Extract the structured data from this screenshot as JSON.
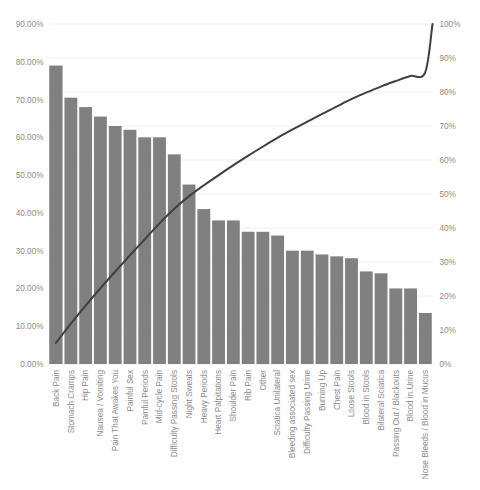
{
  "chart_data": {
    "type": "bar",
    "title": "",
    "subtitle": "",
    "xlabel": "",
    "ylabel": "",
    "y2label": "",
    "ylim": [
      0,
      90
    ],
    "y2lim": [
      0,
      100
    ],
    "grid": true,
    "legend": "none",
    "colors": {
      "bar": "#808080",
      "line": "#3f3f3f",
      "grid": "#e8e8e8",
      "text": "#8c8c8c",
      "background": "#ffffff"
    },
    "categories": [
      "Back Pain",
      "Stomach Cramps",
      "Hip Pain",
      "Nausea / Vomiting",
      "Pain That Awakes You",
      "Painful Sex",
      "Painful Periods",
      "Mid-cycle Pain",
      "Difficulty Passing Stools",
      "Night Sweats",
      "Heavy Periods",
      "Heart Palpitations",
      "Shoulder Pain",
      "Rib Pain",
      "Other",
      "Sciatica Unilateral",
      "Bleeding associated sex",
      "Difficulty Passing Urine",
      "Burning Up",
      "Chest Pain",
      "Loose Stools",
      "Blood in Stools",
      "Bilateral Sciatica",
      "Passing Out / Blackouts",
      "Blood in Urine",
      "Nose Bleeds / Blood in Mucus"
    ],
    "values": [
      79.0,
      70.5,
      68.0,
      65.5,
      63.0,
      62.0,
      60.0,
      60.0,
      55.5,
      47.5,
      41.0,
      38.0,
      38.0,
      35.0,
      35.0,
      34.0,
      30.0,
      30.0,
      29.0,
      28.5,
      28.0,
      24.5,
      24.0,
      20.0,
      20.0,
      13.5
    ],
    "cumulative_percent": [
      6.2,
      11.8,
      17.1,
      22.2,
      27.1,
      31.9,
      36.6,
      41.3,
      45.6,
      49.3,
      52.5,
      55.5,
      58.4,
      61.2,
      63.9,
      66.5,
      68.9,
      71.2,
      73.5,
      75.7,
      77.9,
      79.8,
      81.6,
      83.2,
      84.7,
      85.7
    ],
    "y_ticks": [
      "0.00%",
      "10.00%",
      "20.00%",
      "30.00%",
      "40.00%",
      "50.00%",
      "60.00%",
      "70.00%",
      "80.00%",
      "90.00%"
    ],
    "y_tick_values": [
      0,
      10,
      20,
      30,
      40,
      50,
      60,
      70,
      80,
      90
    ],
    "y2_ticks": [
      "0%",
      "10%",
      "20%",
      "30%",
      "40%",
      "50%",
      "60%",
      "70%",
      "80%",
      "90%",
      "100%"
    ],
    "y2_tick_values": [
      0,
      10,
      20,
      30,
      40,
      50,
      60,
      70,
      80,
      90,
      100
    ]
  }
}
